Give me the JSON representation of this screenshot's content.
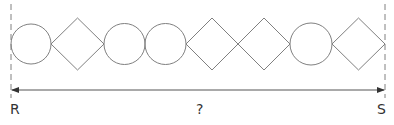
{
  "diagram": {
    "stroke_color": "#808080",
    "text_color": "#333333",
    "shapes": [
      {
        "type": "circle",
        "cx": 31,
        "cy": 44,
        "r": 20
      },
      {
        "type": "diamond",
        "x0": 51,
        "x1": 104,
        "cy": 44,
        "h": 26
      },
      {
        "type": "circle",
        "cx": 124.5,
        "cy": 44,
        "r": 20.5
      },
      {
        "type": "circle",
        "cx": 165.5,
        "cy": 44,
        "r": 20.5
      },
      {
        "type": "diamond",
        "x0": 186,
        "x1": 238,
        "cy": 44,
        "h": 26
      },
      {
        "type": "diamond",
        "x0": 238,
        "x1": 290,
        "cy": 44,
        "h": 26
      },
      {
        "type": "circle",
        "cx": 311,
        "cy": 44,
        "r": 21
      },
      {
        "type": "diamond",
        "x0": 332,
        "x1": 385,
        "cy": 44,
        "h": 26
      }
    ],
    "left_marker": {
      "label": "R",
      "x": 11
    },
    "right_marker": {
      "label": "S",
      "x": 385
    },
    "dimension_label": "?"
  }
}
